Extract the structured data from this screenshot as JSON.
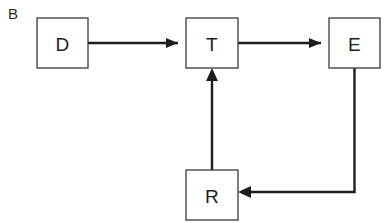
{
  "panel": {
    "label": "B",
    "label_x": 8,
    "label_y": 13
  },
  "colors": {
    "background": "#ffffff",
    "box_stroke": "#3a3a3a",
    "box_fill": "#ffffff",
    "edge_stroke": "#1d1d1d",
    "text": "#1d1d1d"
  },
  "diagram": {
    "type": "flow-diagram",
    "width": 384,
    "height": 223,
    "nodes": [
      {
        "id": "D",
        "label": "D",
        "x": 37,
        "y": 18,
        "w": 51,
        "h": 50,
        "cx": 62.5,
        "cy": 43
      },
      {
        "id": "T",
        "label": "T",
        "x": 186,
        "y": 18,
        "w": 52,
        "h": 50,
        "cx": 212,
        "cy": 43
      },
      {
        "id": "E",
        "label": "E",
        "x": 329,
        "y": 18,
        "w": 51,
        "h": 50,
        "cx": 354.5,
        "cy": 43
      },
      {
        "id": "R",
        "label": "R",
        "x": 186,
        "y": 170,
        "w": 52,
        "h": 50,
        "cx": 212,
        "cy": 195
      }
    ],
    "edges": [
      {
        "id": "D-to-T",
        "from": "D",
        "to": "T",
        "path": "M 88 43 L 178 43",
        "arrow": "M 178 43 L 166 38 L 166 48 Z",
        "direction": "right"
      },
      {
        "id": "T-to-E",
        "from": "T",
        "to": "E",
        "path": "M 238 43 L 321 43",
        "arrow": "M 321 43 L 309 38 L 309 48 Z",
        "direction": "right"
      },
      {
        "id": "R-to-T",
        "from": "R",
        "to": "T",
        "path": "M 212 170 L 212 76",
        "arrow": "M 212 68 L 206 81 L 218 81 Z",
        "direction": "up"
      },
      {
        "id": "E-to-R",
        "from": "E",
        "to": "R",
        "path": "M 354.5 68 L 354.5 192 L 246 192",
        "arrow": "M 238 192 L 251 186 L 251 198 Z",
        "direction": "left"
      }
    ]
  }
}
